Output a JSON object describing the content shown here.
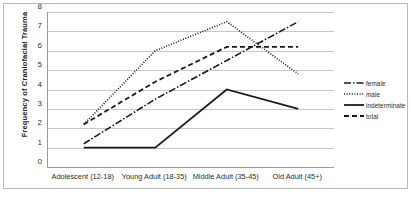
{
  "chart_data": {
    "type": "line",
    "title": "",
    "xlabel": "",
    "ylabel": "Frequency of Craniofacial Trauma",
    "categories": [
      "Adolescent (12-18)",
      "Young Adult (18-35)",
      "Middle Adult (35-45)",
      "Old Adult (45+)"
    ],
    "yticks": [
      0,
      1,
      2,
      3,
      4,
      5,
      6,
      7,
      8
    ],
    "ylim": [
      0,
      8
    ],
    "grid": true,
    "legend_position": "right",
    "series": [
      {
        "name": "female",
        "values": [
          1.2,
          3.5,
          5.5,
          7.5
        ],
        "style": "dash-dot"
      },
      {
        "name": "male",
        "values": [
          2.2,
          6.0,
          7.5,
          4.8
        ],
        "style": "dotted"
      },
      {
        "name": "indeterminate",
        "values": [
          1.0,
          1.0,
          4.0,
          3.0
        ],
        "style": "solid"
      },
      {
        "name": "total",
        "values": [
          2.2,
          4.4,
          6.2,
          6.2
        ],
        "style": "dashed"
      }
    ],
    "line_color": "#1a1a1a"
  },
  "legend": {
    "items": [
      {
        "label": "female"
      },
      {
        "label": "male"
      },
      {
        "label": "indeterminate"
      },
      {
        "label": "total"
      }
    ]
  }
}
